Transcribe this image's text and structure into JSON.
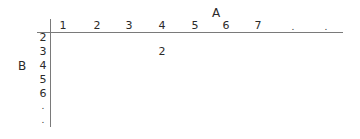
{
  "table": {
    "column_axis_title": "A",
    "row_axis_title": "B",
    "columns": [
      "1",
      "2",
      "3",
      "4",
      "5",
      "6",
      "7",
      ".",
      "."
    ],
    "rows": [
      "2",
      "3",
      "4",
      "5",
      "6",
      ".",
      "."
    ],
    "cells": [
      {
        "row": "3",
        "column": "4",
        "value": "2"
      }
    ]
  }
}
